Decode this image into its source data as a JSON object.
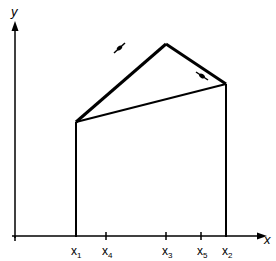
{
  "diagram": {
    "axes": {
      "x_label": "x",
      "y_label": "y"
    },
    "tick_labels": [
      {
        "id": "x1",
        "base": "x",
        "sub": "1"
      },
      {
        "id": "x4",
        "base": "x",
        "sub": "4"
      },
      {
        "id": "x3",
        "base": "x",
        "sub": "3"
      },
      {
        "id": "x5",
        "base": "x",
        "sub": "5"
      },
      {
        "id": "x2",
        "base": "x",
        "sub": "2"
      }
    ],
    "colors": {
      "stroke": "#000000",
      "background": "#ffffff"
    }
  }
}
